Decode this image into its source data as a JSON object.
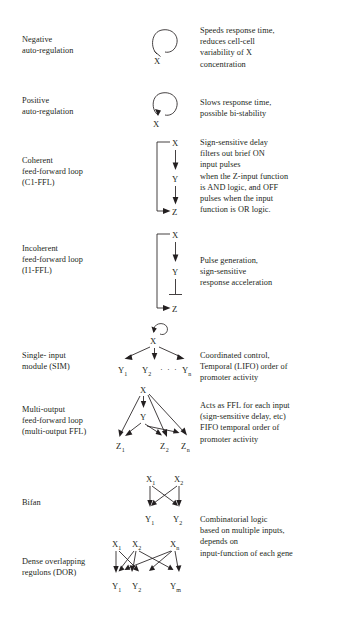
{
  "figure": {
    "background": "#ffffff",
    "ink": "#231f20",
    "columns": [
      "motif name",
      "motif diagram",
      "function"
    ]
  },
  "rows": [
    {
      "id": "negative-auto-regulation",
      "name_lines": [
        "Negative",
        "auto-regulation"
      ],
      "diagram": {
        "type": "self-loop",
        "nodes": [
          "X"
        ],
        "edges": [
          {
            "from": "X",
            "to": "X",
            "sign": "repression",
            "head": "bar"
          }
        ]
      },
      "desc_lines": [
        "Speeds response time,",
        "reduces cell-cell",
        "variability of X",
        "concentration"
      ]
    },
    {
      "id": "positive-auto-regulation",
      "name_lines": [
        "Positive",
        "auto-regulation"
      ],
      "diagram": {
        "type": "self-loop",
        "nodes": [
          "X"
        ],
        "edges": [
          {
            "from": "X",
            "to": "X",
            "sign": "activation",
            "head": "arrow"
          }
        ]
      },
      "desc_lines": [
        "Slows response time,",
        "possible bi-stability"
      ]
    },
    {
      "id": "coherent-feed-forward-loop",
      "name_lines": [
        "Coherent",
        "feed-forward loop",
        "(C1-FFL)"
      ],
      "diagram": {
        "type": "feed-forward-loop",
        "nodes": [
          "X",
          "Y",
          "Z"
        ],
        "edges": [
          {
            "from": "X",
            "to": "Y",
            "sign": "activation",
            "head": "arrow"
          },
          {
            "from": "Y",
            "to": "Z",
            "sign": "activation",
            "head": "arrow"
          },
          {
            "from": "X",
            "to": "Z",
            "sign": "activation",
            "head": "arrow",
            "route": "bypass-left"
          }
        ]
      },
      "desc_lines": [
        "Sign-sensitive delay",
        "filters out brief ON",
        "input pulses",
        "when the Z-input function",
        "is AND logic, and OFF",
        "pulses when the input",
        "function is OR logic."
      ]
    },
    {
      "id": "incoherent-feed-forward-loop",
      "name_lines": [
        "Incoherent",
        "feed-forward loop",
        "(I1-FFL)"
      ],
      "diagram": {
        "type": "feed-forward-loop",
        "nodes": [
          "X",
          "Y",
          "Z"
        ],
        "edges": [
          {
            "from": "X",
            "to": "Y",
            "sign": "activation",
            "head": "arrow"
          },
          {
            "from": "Y",
            "to": "Z",
            "sign": "repression",
            "head": "bar"
          },
          {
            "from": "X",
            "to": "Z",
            "sign": "activation",
            "head": "arrow",
            "route": "bypass-left"
          }
        ]
      },
      "desc_lines": [
        "Pulse generation,",
        "sign-sensitive",
        "response acceleration"
      ]
    },
    {
      "id": "single-input-module",
      "name_lines": [
        "Single- input",
        "module (SIM)"
      ],
      "diagram": {
        "type": "single-input-module",
        "nodes": [
          "X",
          "Y1",
          "Y2",
          "Yn"
        ],
        "ellipsis": "· · ·",
        "edges": [
          {
            "from": "X",
            "to": "X",
            "sign": "activation",
            "head": "arrow"
          },
          {
            "from": "X",
            "to": "Y1",
            "sign": "activation",
            "head": "arrow"
          },
          {
            "from": "X",
            "to": "Y2",
            "sign": "activation",
            "head": "arrow"
          },
          {
            "from": "X",
            "to": "Yn",
            "sign": "activation",
            "head": "arrow"
          }
        ]
      },
      "desc_lines": [
        "Coordinated control,",
        "Temporal (LIFO) order of",
        "promoter activity"
      ]
    },
    {
      "id": "multi-output-feed-forward-loop",
      "name_lines": [
        "Multi-output",
        "feed-forward loop",
        "(multi-output  FFL)"
      ],
      "diagram": {
        "type": "multi-output-ffl",
        "nodes": [
          "X",
          "Y",
          "Z1",
          "Z2",
          "Zn"
        ],
        "edges": [
          {
            "from": "X",
            "to": "Y",
            "sign": "activation",
            "head": "arrow"
          },
          {
            "from": "X",
            "to": "Z1",
            "sign": "activation",
            "head": "arrow"
          },
          {
            "from": "X",
            "to": "Z2",
            "sign": "activation",
            "head": "arrow"
          },
          {
            "from": "X",
            "to": "Zn",
            "sign": "activation",
            "head": "arrow"
          },
          {
            "from": "Y",
            "to": "Z1",
            "sign": "activation",
            "head": "arrow"
          },
          {
            "from": "Y",
            "to": "Z2",
            "sign": "activation",
            "head": "arrow"
          },
          {
            "from": "Y",
            "to": "Zn",
            "sign": "activation",
            "head": "arrow"
          }
        ]
      },
      "desc_lines": [
        "Acts as FFL for each input",
        "(sign-sensitive delay, etc)",
        "FIFO temporal order of",
        "promoter activity"
      ]
    },
    {
      "id": "bifan",
      "name_lines": [
        "Bifan"
      ],
      "diagram": {
        "type": "bifan",
        "nodes": [
          "X1",
          "X2",
          "Y1",
          "Y2"
        ],
        "edges": [
          {
            "from": "X1",
            "to": "Y1",
            "sign": "activation",
            "head": "arrow"
          },
          {
            "from": "X1",
            "to": "Y2",
            "sign": "activation",
            "head": "arrow"
          },
          {
            "from": "X2",
            "to": "Y1",
            "sign": "activation",
            "head": "arrow"
          },
          {
            "from": "X2",
            "to": "Y2",
            "sign": "activation",
            "head": "arrow"
          }
        ]
      },
      "desc_lines": []
    },
    {
      "id": "dense-overlapping-regulons",
      "name_lines": [
        "Dense overlapping",
        "regulons (DOR)"
      ],
      "diagram": {
        "type": "dense-overlapping-regulons",
        "nodes": [
          "X1",
          "X2",
          "Xn",
          "Y1",
          "Y2",
          "Ym"
        ],
        "edges": [
          {
            "from": "X1",
            "to": "Y1",
            "sign": "activation",
            "head": "arrow"
          },
          {
            "from": "X1",
            "to": "Y2",
            "sign": "activation",
            "head": "arrow"
          },
          {
            "from": "X2",
            "to": "Y1",
            "sign": "activation",
            "head": "arrow"
          },
          {
            "from": "X2",
            "to": "Y2",
            "sign": "activation",
            "head": "arrow"
          },
          {
            "from": "X2",
            "to": "Ym",
            "sign": "activation",
            "head": "arrow"
          },
          {
            "from": "Xn",
            "to": "Y1",
            "sign": "activation",
            "head": "arrow"
          },
          {
            "from": "Xn",
            "to": "Y2",
            "sign": "activation",
            "head": "arrow"
          },
          {
            "from": "Xn",
            "to": "Ym",
            "sign": "activation",
            "head": "arrow"
          }
        ]
      },
      "desc_lines": [
        "Combinatorial logic",
        "based on multiple inputs,",
        "depends on",
        "input-function of each gene"
      ]
    }
  ],
  "node_labels": {
    "X": "X",
    "Y": "Y",
    "Z": "Z",
    "X1_base": "X",
    "X1_sub": "1",
    "X2_base": "X",
    "X2_sub": "2",
    "Xn_base": "X",
    "Xn_sub": "n",
    "Y1_base": "Y",
    "Y1_sub": "1",
    "Y2_base": "Y",
    "Y2_sub": "2",
    "Yn_base": "Y",
    "Yn_sub": "n",
    "Ym_base": "Y",
    "Ym_sub": "m",
    "Z1_base": "Z",
    "Z1_sub": "1",
    "Z2_base": "Z",
    "Z2_sub": "2",
    "Zn_base": "Z",
    "Zn_sub": "n",
    "ellipsis": "· · ·"
  }
}
